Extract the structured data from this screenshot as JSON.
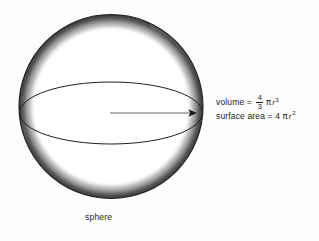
{
  "figure": {
    "title_label": "sphere",
    "shape_name": "sphere-illustration",
    "background_color": "#fdfdfd",
    "outline_color": "#1a1a1a",
    "shading_color": "#6e6e6e",
    "arrow_color": "#8e8e8e"
  },
  "formulas": {
    "volume": {
      "label": "volume",
      "equals": "=",
      "numerator": "4",
      "denominator": "3",
      "pi": "π",
      "variable": "r",
      "exponent": "3",
      "full_text": "volume = 4/3 π r³"
    },
    "surface_area": {
      "label": "surface area",
      "equals": "=",
      "coefficient": "4",
      "pi": "π",
      "variable": "r",
      "exponent": "2",
      "full_text": "surface area = 4 π r²"
    }
  },
  "annotations": {
    "radius_arrow": "radius"
  }
}
